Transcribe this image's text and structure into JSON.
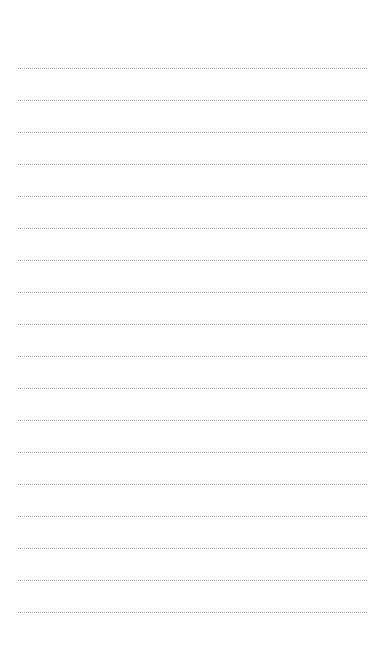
{
  "page": {
    "type": "lined-paper",
    "line_count": 18,
    "first_line_y": 68,
    "line_spacing": 32,
    "line_left": 18,
    "line_width": 349,
    "line_color": "#b8b8b8",
    "background": "#ffffff"
  }
}
